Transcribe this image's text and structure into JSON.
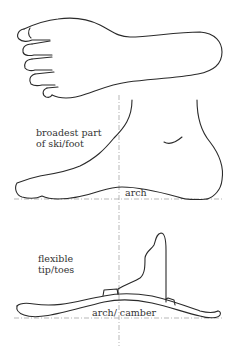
{
  "diagram": {
    "labels": {
      "broadest_line1": "broadest part",
      "broadest_line2": "of ski/foot",
      "foot_arch": "arch",
      "flexible_line1": "flexible",
      "flexible_line2": "tip/toes",
      "arch_camber": "arch/ camber"
    },
    "figures": [
      {
        "name": "foot-sole-top-view",
        "description": "Outline of foot seen from above with five toes"
      },
      {
        "name": "foot-side-view",
        "description": "Outline of foot seen from the side showing arch"
      },
      {
        "name": "ski-with-boot-side-view",
        "description": "Ski seen from side with boot silhouette showing camber"
      }
    ],
    "colors": {
      "line": "#2a2a2a",
      "guide": "#9a9a9a",
      "text": "#333333",
      "background": "#ffffff"
    }
  }
}
